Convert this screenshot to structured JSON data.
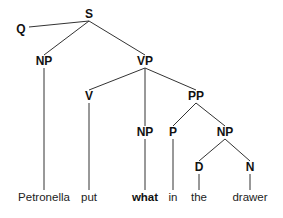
{
  "diagram": {
    "type": "syntax-tree",
    "line_color": "#333333",
    "nodes": [
      {
        "id": "S",
        "label": "S",
        "x": 89,
        "y": 14
      },
      {
        "id": "Q",
        "label": "Q",
        "x": 21,
        "y": 29
      },
      {
        "id": "NP1",
        "label": "NP",
        "x": 44,
        "y": 61
      },
      {
        "id": "VP",
        "label": "VP",
        "x": 145,
        "y": 61
      },
      {
        "id": "V",
        "label": "V",
        "x": 89,
        "y": 96
      },
      {
        "id": "PP",
        "label": "PP",
        "x": 196,
        "y": 96
      },
      {
        "id": "NP2",
        "label": "NP",
        "x": 145,
        "y": 132
      },
      {
        "id": "P",
        "label": "P",
        "x": 173,
        "y": 132
      },
      {
        "id": "NP3",
        "label": "NP",
        "x": 225,
        "y": 132
      },
      {
        "id": "D",
        "label": "D",
        "x": 199,
        "y": 167
      },
      {
        "id": "N",
        "label": "N",
        "x": 250,
        "y": 167
      }
    ],
    "leaves": [
      {
        "id": "w1",
        "label": "Petronella",
        "x": 44,
        "y": 198,
        "bold": false
      },
      {
        "id": "w2",
        "label": "put",
        "x": 89,
        "y": 198,
        "bold": false
      },
      {
        "id": "w3",
        "label": "what",
        "x": 145,
        "y": 198,
        "bold": true
      },
      {
        "id": "w4",
        "label": "in",
        "x": 173,
        "y": 198,
        "bold": false
      },
      {
        "id": "w5",
        "label": "the",
        "x": 199,
        "y": 198,
        "bold": false
      },
      {
        "id": "w6",
        "label": "drawer",
        "x": 250,
        "y": 198,
        "bold": false
      }
    ],
    "edges": [
      {
        "from": [
          89,
          21
        ],
        "to": [
          29,
          27
        ]
      },
      {
        "from": [
          89,
          21
        ],
        "to": [
          44,
          55
        ]
      },
      {
        "from": [
          89,
          21
        ],
        "to": [
          145,
          55
        ]
      },
      {
        "from": [
          44,
          68
        ],
        "to": [
          44,
          190
        ]
      },
      {
        "from": [
          145,
          68
        ],
        "to": [
          89,
          90
        ]
      },
      {
        "from": [
          145,
          68
        ],
        "to": [
          145,
          126
        ]
      },
      {
        "from": [
          145,
          68
        ],
        "to": [
          196,
          90
        ]
      },
      {
        "from": [
          89,
          103
        ],
        "to": [
          89,
          190
        ]
      },
      {
        "from": [
          196,
          103
        ],
        "to": [
          173,
          126
        ]
      },
      {
        "from": [
          196,
          103
        ],
        "to": [
          225,
          126
        ]
      },
      {
        "from": [
          145,
          139
        ],
        "to": [
          145,
          190
        ]
      },
      {
        "from": [
          173,
          139
        ],
        "to": [
          173,
          190
        ]
      },
      {
        "from": [
          225,
          139
        ],
        "to": [
          199,
          161
        ]
      },
      {
        "from": [
          225,
          139
        ],
        "to": [
          250,
          161
        ]
      },
      {
        "from": [
          199,
          174
        ],
        "to": [
          199,
          190
        ]
      },
      {
        "from": [
          250,
          174
        ],
        "to": [
          250,
          190
        ]
      }
    ]
  }
}
